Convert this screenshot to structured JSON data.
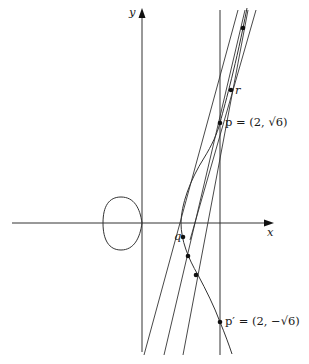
{
  "figure": {
    "curve_equation": "y^2 = x^3 - x",
    "axes": {
      "x_label": "x",
      "y_label": "y"
    },
    "points": {
      "p": {
        "name": "p",
        "label": "p = (2, √6)",
        "x": 2,
        "y": 2.449
      },
      "p_prime": {
        "name": "p'",
        "label": "p′ = (2, −√6)",
        "x": 2,
        "y": -2.449
      },
      "q": {
        "name": "q",
        "label": "q"
      },
      "r": {
        "name": "r",
        "label": "r"
      }
    },
    "vertical_line": {
      "x": 2
    },
    "colors": {
      "ink": "#1a1a1a",
      "background": "#ffffff"
    }
  }
}
